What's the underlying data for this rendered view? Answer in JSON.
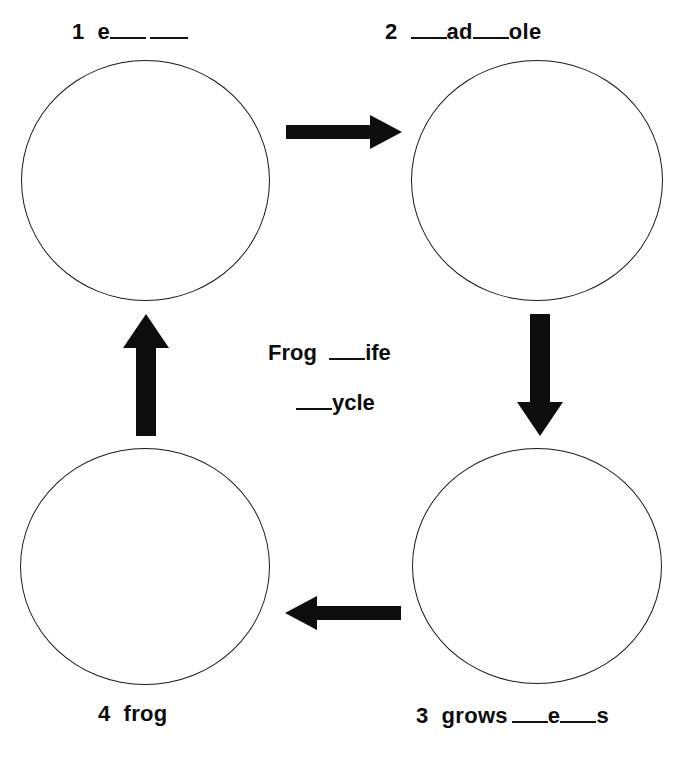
{
  "page": {
    "background_color": "#ffffff",
    "ink_color": "#0d0d0d"
  },
  "center": {
    "line1_word": "Frog",
    "line1_suffix": "ife",
    "line2_suffix": "ycle"
  },
  "stages": [
    {
      "id": "stage-1",
      "number": "1",
      "position": "top-left",
      "text_prefix": "e",
      "text_suffix": "",
      "blanks": 2
    },
    {
      "id": "stage-2",
      "number": "2",
      "position": "top-right",
      "text_prefix": "",
      "text_middle": "ad",
      "text_suffix": "ole",
      "blanks": 2
    },
    {
      "id": "stage-3",
      "number": "3",
      "position": "bottom-right",
      "word": "grows",
      "text_middle": "e",
      "text_suffix": "s",
      "blanks": 2
    },
    {
      "id": "stage-4",
      "number": "4",
      "position": "bottom-left",
      "word": "frog",
      "blanks": 0
    }
  ],
  "arrows": [
    {
      "id": "arrow-1-to-2",
      "direction": "right",
      "from": "stage-1",
      "to": "stage-2"
    },
    {
      "id": "arrow-2-to-3",
      "direction": "down",
      "from": "stage-2",
      "to": "stage-3"
    },
    {
      "id": "arrow-3-to-4",
      "direction": "left",
      "from": "stage-3",
      "to": "stage-4"
    },
    {
      "id": "arrow-4-to-1",
      "direction": "up",
      "from": "stage-4",
      "to": "stage-1"
    }
  ]
}
